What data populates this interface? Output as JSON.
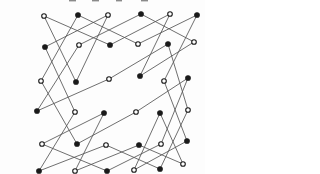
{
  "canvas": {
    "width": 205,
    "height": 174,
    "background": "#fdfdfd"
  },
  "figure": {
    "kind": "knight-move-graph-on-6x6-grid",
    "edge_color": "#555555",
    "vertex_stroke_color": "#1a1a1a",
    "vertex_open_fill": "#ffffff",
    "vertex_filled_fill": "#1a1a1a",
    "vertex_radius": 2.3,
    "vertices": [
      {
        "id": "c1r1",
        "x": 44,
        "y": 16,
        "type": "open"
      },
      {
        "id": "c2r1",
        "x": 78,
        "y": 15,
        "type": "filled"
      },
      {
        "id": "c3r1",
        "x": 108,
        "y": 15,
        "type": "open"
      },
      {
        "id": "c4r1",
        "x": 141,
        "y": 14,
        "type": "filled"
      },
      {
        "id": "c5r1",
        "x": 170,
        "y": 14,
        "type": "open"
      },
      {
        "id": "c6r1",
        "x": 197,
        "y": 15,
        "type": "filled"
      },
      {
        "id": "c1r2",
        "x": 45,
        "y": 47,
        "type": "filled"
      },
      {
        "id": "c2r2",
        "x": 79,
        "y": 45,
        "type": "open"
      },
      {
        "id": "c3r2",
        "x": 110,
        "y": 45,
        "type": "filled"
      },
      {
        "id": "c4r2",
        "x": 138,
        "y": 44,
        "type": "open"
      },
      {
        "id": "c5r2",
        "x": 168,
        "y": 44,
        "type": "filled"
      },
      {
        "id": "c6r2",
        "x": 194,
        "y": 42,
        "type": "open"
      },
      {
        "id": "c1r3",
        "x": 41,
        "y": 81,
        "type": "open"
      },
      {
        "id": "c2r3",
        "x": 76,
        "y": 82,
        "type": "filled"
      },
      {
        "id": "c3r3",
        "x": 109,
        "y": 79,
        "type": "open"
      },
      {
        "id": "c4r3",
        "x": 140,
        "y": 76,
        "type": "filled"
      },
      {
        "id": "c5r3",
        "x": 164,
        "y": 81,
        "type": "open"
      },
      {
        "id": "c6r3",
        "x": 188,
        "y": 78,
        "type": "filled"
      },
      {
        "id": "c1r4",
        "x": 37,
        "y": 111,
        "type": "filled"
      },
      {
        "id": "c2r4",
        "x": 75,
        "y": 112,
        "type": "open"
      },
      {
        "id": "c3r4",
        "x": 104,
        "y": 113,
        "type": "filled"
      },
      {
        "id": "c4r4",
        "x": 136,
        "y": 112,
        "type": "open"
      },
      {
        "id": "c5r4",
        "x": 160,
        "y": 113,
        "type": "filled"
      },
      {
        "id": "c6r4",
        "x": 188,
        "y": 110,
        "type": "open"
      },
      {
        "id": "c1r5",
        "x": 42,
        "y": 144,
        "type": "open"
      },
      {
        "id": "c2r5",
        "x": 77,
        "y": 144,
        "type": "filled"
      },
      {
        "id": "c3r5",
        "x": 106,
        "y": 145,
        "type": "open"
      },
      {
        "id": "c4r5",
        "x": 139,
        "y": 145,
        "type": "filled"
      },
      {
        "id": "c5r5",
        "x": 161,
        "y": 144,
        "type": "open"
      },
      {
        "id": "c6r5",
        "x": 187,
        "y": 141,
        "type": "filled"
      },
      {
        "id": "c1r6",
        "x": 39,
        "y": 171,
        "type": "filled"
      },
      {
        "id": "c2r6",
        "x": 75,
        "y": 171,
        "type": "open"
      },
      {
        "id": "c3r6",
        "x": 107,
        "y": 171,
        "type": "filled"
      },
      {
        "id": "c4r6",
        "x": 134,
        "y": 170,
        "type": "open"
      },
      {
        "id": "c5r6",
        "x": 160,
        "y": 169,
        "type": "filled"
      },
      {
        "id": "c6r6",
        "x": 183,
        "y": 164,
        "type": "open"
      }
    ],
    "edges": [
      [
        "c1r1",
        "c2r3"
      ],
      [
        "c2r3",
        "c3r1"
      ],
      [
        "c3r1",
        "c1r2"
      ],
      [
        "c1r2",
        "c2r4"
      ],
      [
        "c2r4",
        "c1r6"
      ],
      [
        "c1r6",
        "c3r5"
      ],
      [
        "c3r5",
        "c5r6"
      ],
      [
        "c5r6",
        "c6r4"
      ],
      [
        "c6r4",
        "c5r2"
      ],
      [
        "c5r2",
        "c3r3"
      ],
      [
        "c3r3",
        "c1r4"
      ],
      [
        "c1r4",
        "c2r2"
      ],
      [
        "c2r2",
        "c4r1"
      ],
      [
        "c4r1",
        "c6r2"
      ],
      [
        "c6r2",
        "c4r3"
      ],
      [
        "c4r3",
        "c5r1"
      ],
      [
        "c5r1",
        "c3r2"
      ],
      [
        "c3r2",
        "c1r1"
      ],
      [
        "c6r6",
        "c5r4"
      ],
      [
        "c5r4",
        "c4r6"
      ],
      [
        "c4r6",
        "c6r5"
      ],
      [
        "c6r5",
        "c5r3"
      ],
      [
        "c5r3",
        "c6r1"
      ],
      [
        "c6r1",
        "c4r2"
      ],
      [
        "c4r2",
        "c2r1"
      ],
      [
        "c2r1",
        "c1r3"
      ],
      [
        "c1r3",
        "c2r5"
      ],
      [
        "c2r5",
        "c4r4"
      ],
      [
        "c4r4",
        "c6r3"
      ],
      [
        "c6r3",
        "c5r5"
      ],
      [
        "c5r5",
        "c3r6"
      ],
      [
        "c3r6",
        "c1r5"
      ],
      [
        "c1r5",
        "c3r4"
      ],
      [
        "c3r4",
        "c2r6"
      ],
      [
        "c2r6",
        "c4r5"
      ],
      [
        "c4r5",
        "c6r6"
      ]
    ],
    "top_edge_marks": [
      {
        "x": 69,
        "y": 0,
        "w": 7,
        "h": 1.4
      },
      {
        "x": 92,
        "y": 0,
        "w": 7,
        "h": 1.4
      },
      {
        "x": 116,
        "y": 0,
        "w": 6,
        "h": 1.4
      },
      {
        "x": 141,
        "y": 0,
        "w": 7,
        "h": 1.4
      }
    ]
  }
}
